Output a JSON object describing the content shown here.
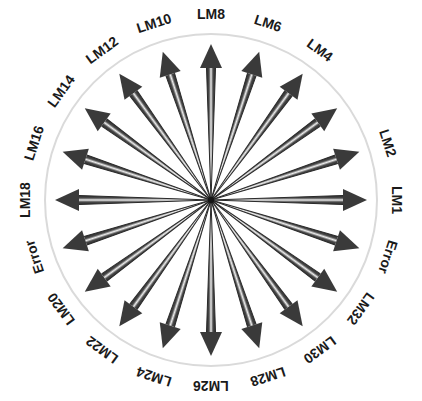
{
  "figure": {
    "type": "radial-arrow-diagram",
    "title": "",
    "background_color": "#ffffff",
    "center": {
      "x": 211,
      "y": 200
    },
    "circle": {
      "radius": 166,
      "stroke_color": "#d8d8d8",
      "stroke_width": 2,
      "fill": "none"
    },
    "hub": {
      "radius": 3,
      "color": "#1c1c1c"
    },
    "arrow_style": {
      "shaft_dark_color": "#3d3d3d",
      "shaft_edge_color": "#2a2a2a",
      "shaft_highlight_color": "#e8e8e8",
      "head_color": "#3a3a3a",
      "count": 20,
      "angle_step_degrees": 18,
      "shaft_length": 132,
      "head_length": 24,
      "head_half_width": 11,
      "shaft_half_width": 4.5
    },
    "label_style": {
      "font_size": 14,
      "font_weight": "bold",
      "color": "#1a1a1a",
      "radius": 186
    }
  },
  "chart_data": {
    "type": "radial",
    "title": "",
    "categories": [
      "LM1",
      "LM2",
      "LM4",
      "LM6",
      "LM8",
      "LM10",
      "LM12",
      "LM14",
      "LM16",
      "LM18",
      "Error",
      "LM20",
      "LM22",
      "LM24",
      "LM26",
      "LM28",
      "LM30",
      "LM32",
      "Error",
      ""
    ],
    "values": [
      1,
      1,
      1,
      1,
      1,
      1,
      1,
      1,
      1,
      1,
      1,
      1,
      1,
      1,
      1,
      1,
      1,
      1,
      1,
      1
    ],
    "xlabel": "",
    "ylabel": "",
    "legend": [],
    "grid": false,
    "note": "Twenty equal-length arrows radiate from a common center at 18-degree intervals; each is annotated with a label placed outside the bounding circle."
  },
  "spokes": [
    {
      "label": "LM1",
      "angle": 0
    },
    {
      "label": "LM2",
      "angle": 18
    },
    {
      "label": "",
      "angle": 36
    },
    {
      "label": "LM4",
      "angle": 54
    },
    {
      "label": "LM6",
      "angle": 72
    },
    {
      "label": "LM8",
      "angle": 90
    },
    {
      "label": "LM10",
      "angle": 108
    },
    {
      "label": "LM12",
      "angle": 126
    },
    {
      "label": "LM14",
      "angle": 144
    },
    {
      "label": "LM16",
      "angle": 162
    },
    {
      "label": "LM18",
      "angle": 180
    },
    {
      "label": "Error",
      "angle": 198
    },
    {
      "label": "LM20",
      "angle": 216
    },
    {
      "label": "LM22",
      "angle": 234
    },
    {
      "label": "LM24",
      "angle": 252
    },
    {
      "label": "LM26",
      "angle": 270
    },
    {
      "label": "LM28",
      "angle": 288
    },
    {
      "label": "LM30",
      "angle": 306
    },
    {
      "label": "LM32",
      "angle": 324
    },
    {
      "label": "Error",
      "angle": 342
    }
  ]
}
